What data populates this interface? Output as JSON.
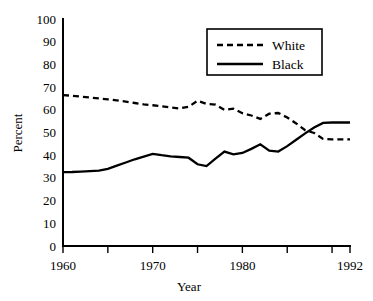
{
  "chart_data": {
    "type": "line",
    "title": "",
    "xlabel": "Year",
    "ylabel": "Percent",
    "xlim": [
      1960,
      1992
    ],
    "ylim": [
      0,
      100
    ],
    "grid": false,
    "legend_position": "top-right",
    "xticks": [
      1960,
      1965,
      1970,
      1975,
      1980,
      1985,
      1990,
      1992
    ],
    "xtick_labels": [
      "1960",
      "",
      "1970",
      "",
      "1980",
      "",
      "",
      "1992"
    ],
    "yticks": [
      0,
      10,
      20,
      30,
      40,
      50,
      60,
      70,
      80,
      90,
      100
    ],
    "ytick_labels": [
      "0",
      "10",
      "20",
      "30",
      "40",
      "50",
      "60",
      "70",
      "80",
      "90",
      "100"
    ],
    "x": [
      1960,
      1961,
      1962,
      1963,
      1964,
      1965,
      1966,
      1967,
      1968,
      1969,
      1970,
      1971,
      1972,
      1973,
      1974,
      1975,
      1976,
      1977,
      1978,
      1979,
      1980,
      1981,
      1982,
      1983,
      1984,
      1985,
      1986,
      1987,
      1988,
      1989,
      1990,
      1991,
      1992
    ],
    "series": [
      {
        "name": "White",
        "style": "dashed",
        "color": "#000000",
        "values": [
          66.5,
          66.2,
          65.8,
          65.4,
          65.0,
          64.6,
          64.2,
          63.6,
          63.0,
          62.4,
          62.0,
          61.5,
          61.0,
          60.6,
          61.3,
          64.0,
          62.6,
          62.3,
          60.0,
          60.5,
          58.5,
          57.5,
          56.0,
          58.3,
          58.6,
          56.6,
          54.0,
          51.0,
          49.8,
          47.2,
          47.0,
          47.0,
          47.0
        ]
      },
      {
        "name": "Black",
        "style": "solid",
        "color": "#000000",
        "values": [
          32.5,
          32.6,
          32.8,
          33.0,
          33.2,
          34.0,
          35.4,
          36.8,
          38.2,
          39.4,
          40.6,
          40.0,
          39.5,
          39.2,
          38.9,
          36.0,
          35.2,
          38.5,
          41.6,
          40.4,
          41.0,
          42.8,
          44.8,
          42.0,
          41.6,
          44.0,
          46.8,
          49.6,
          52.2,
          54.2,
          54.4,
          54.4,
          54.4
        ]
      }
    ]
  },
  "legend": {
    "entries": [
      {
        "label": "White",
        "style": "dashed"
      },
      {
        "label": "Black",
        "style": "solid"
      }
    ]
  },
  "axes": {
    "y_title": "Percent",
    "x_title": "Year"
  }
}
